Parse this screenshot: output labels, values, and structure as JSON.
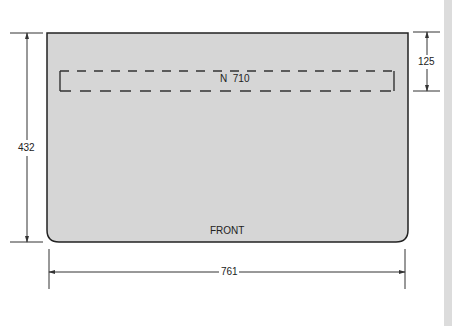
{
  "diagram": {
    "panel": {
      "fill": "#d6d6d6",
      "stroke": "#222222",
      "front_label": "FRONT"
    },
    "cutout": {
      "label": "N  710",
      "style": "dashed"
    },
    "dimensions": {
      "height": "432",
      "width": "761",
      "cutout_offset": "125"
    }
  }
}
